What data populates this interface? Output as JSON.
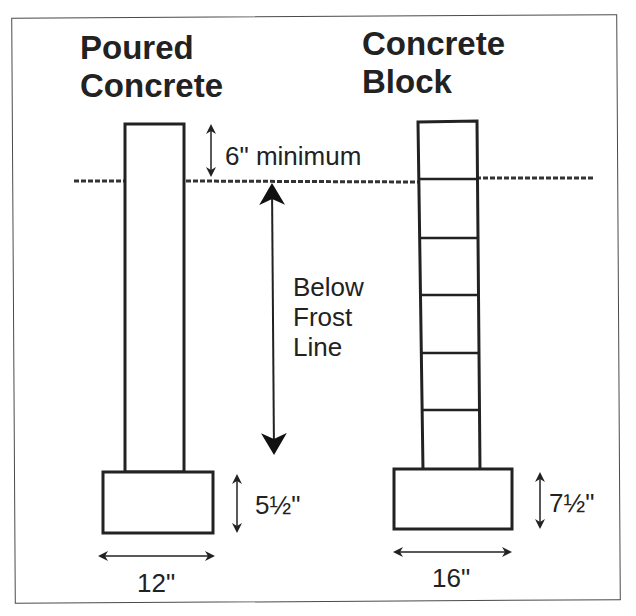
{
  "diagram": {
    "left_column": {
      "title_line1": "Poured",
      "title_line2": "Concrete",
      "footing_height": "5½\"",
      "footing_width": "12\""
    },
    "right_column": {
      "title_line1": "Concrete",
      "title_line2": "Block",
      "footing_height": "7½\"",
      "footing_width": "16\"",
      "block_courses": 6
    },
    "annotations": {
      "above_grade": "6\" minimum",
      "frost_line_line1": "Below",
      "frost_line_line2": "Frost",
      "frost_line_line3": "Line"
    },
    "colors": {
      "line": "#222222",
      "background": "#ffffff"
    }
  }
}
